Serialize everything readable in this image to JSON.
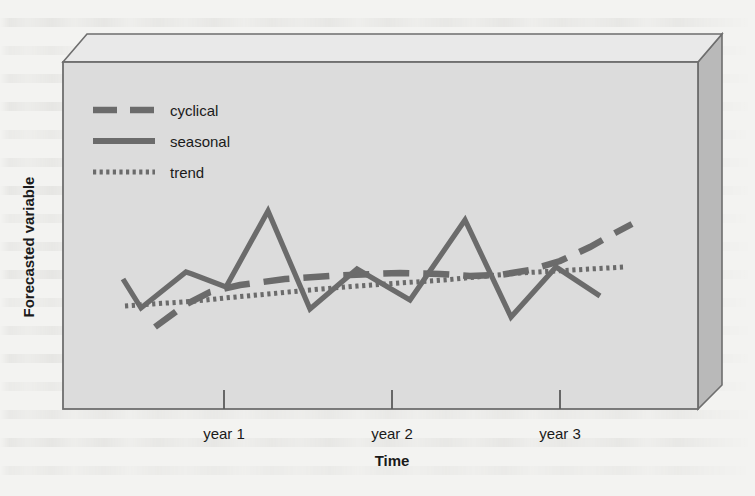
{
  "chart_data": {
    "type": "line",
    "title": "",
    "xlabel": "Time",
    "ylabel": "Forecasted variable",
    "grid": false,
    "legend_position": "top-left",
    "xlim": [
      0,
      3.4
    ],
    "ylim": [
      0,
      10
    ],
    "x_tick_labels": [
      "year 1",
      "year 2",
      "year 3"
    ],
    "x_tick_values": [
      1,
      2,
      3
    ],
    "y_tick_labels": [],
    "series": [
      {
        "name": "cyclical",
        "style": "dashed",
        "color": "#6b6b6b",
        "x": [
          0.33,
          0.63,
          0.98,
          1.45,
          1.95,
          2.42,
          2.78,
          3.03
        ],
        "y": [
          2.05,
          3.25,
          3.95,
          4.5,
          4.72,
          4.66,
          5.3,
          6.6
        ]
      },
      {
        "name": "seasonal",
        "style": "solid",
        "color": "#6b6b6b",
        "x": [
          0.12,
          0.28,
          0.6,
          0.68,
          0.92,
          1.3,
          1.65,
          1.88,
          2.1,
          2.38,
          2.62,
          2.92,
          3.18,
          3.35
        ],
        "y": [
          4.52,
          3.68,
          4.72,
          4.66,
          4.28,
          6.88,
          3.62,
          4.82,
          4.16,
          6.68,
          3.28,
          4.82,
          4.7,
          3.98
        ]
      },
      {
        "name": "trend",
        "style": "dotted",
        "color": "#6b6b6b",
        "x": [
          0.13,
          1.0,
          2.0,
          3.0,
          3.3
        ],
        "y": [
          3.82,
          4.18,
          4.45,
          4.8,
          4.86
        ]
      }
    ]
  },
  "legend": {
    "items": [
      {
        "label": "cyclical",
        "style": "dashed"
      },
      {
        "label": "seasonal",
        "style": "solid"
      },
      {
        "label": "trend",
        "style": "dotted"
      }
    ]
  },
  "colors": {
    "plot_front_face": "#dcdcdc",
    "plot_top_face": "#e9e9e9",
    "plot_right_face": "#b9b9b9",
    "edge_stroke": "#6e6e6e",
    "series_stroke": "#6b6b6b",
    "text": "#1a1a1a",
    "page_background": "#f3f3f1"
  }
}
